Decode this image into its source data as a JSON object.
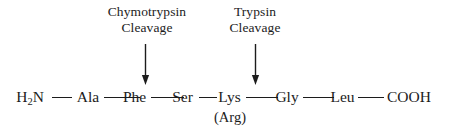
{
  "figure": {
    "background_color": "#ffffff",
    "ink_color": "#1c1c1c"
  },
  "annotations": [
    {
      "id": "chymotrypsin",
      "enzyme": "Chymotrypsin",
      "action": "Cleavage",
      "arrow_icon": "down-arrow-icon",
      "points_between": [
        "Phe",
        "Ser"
      ]
    },
    {
      "id": "trypsin",
      "enzyme": "Trypsin",
      "action": "Cleavage",
      "arrow_icon": "down-arrow-icon",
      "points_between": [
        "Lys",
        "Gly"
      ]
    }
  ],
  "chain": {
    "n_terminus": {
      "text": "H",
      "subscript": "2",
      "text_after": "N"
    },
    "c_terminus": "COOH",
    "residues": [
      {
        "label": "Ala",
        "alternate": ""
      },
      {
        "label": "Phe",
        "alternate": ""
      },
      {
        "label": "Ser",
        "alternate": ""
      },
      {
        "label": "Lys",
        "alternate": "(Arg)"
      },
      {
        "label": "Gly",
        "alternate": ""
      },
      {
        "label": "Leu",
        "alternate": ""
      }
    ]
  }
}
